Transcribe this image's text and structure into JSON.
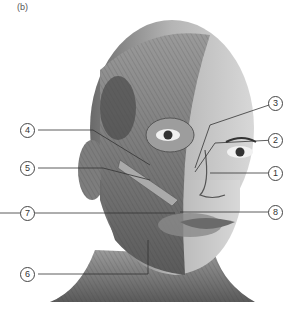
{
  "panel_label": "(b)",
  "callouts": [
    {
      "id": "1",
      "label": "1"
    },
    {
      "id": "2",
      "label": "2"
    },
    {
      "id": "3",
      "label": "3"
    },
    {
      "id": "4",
      "label": "4"
    },
    {
      "id": "5",
      "label": "5"
    },
    {
      "id": "6",
      "label": "6"
    },
    {
      "id": "7",
      "label": "7"
    },
    {
      "id": "8",
      "label": "8"
    }
  ]
}
